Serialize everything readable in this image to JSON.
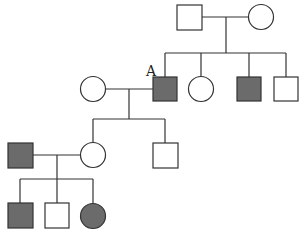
{
  "colors": {
    "affected": "#6b6b6b",
    "unaffected": "#ffffff",
    "line": "#333333"
  },
  "label_A": "A",
  "individuals": [
    {
      "id": "I-1",
      "sex": "male",
      "affected": false
    },
    {
      "id": "I-2",
      "sex": "female",
      "affected": false
    },
    {
      "id": "II-1",
      "sex": "female",
      "affected": false,
      "note": "spouse of A"
    },
    {
      "id": "II-2",
      "sex": "male",
      "affected": true,
      "label": "A"
    },
    {
      "id": "II-3",
      "sex": "female",
      "affected": false
    },
    {
      "id": "II-4",
      "sex": "male",
      "affected": true
    },
    {
      "id": "II-5",
      "sex": "male",
      "affected": false
    },
    {
      "id": "III-1",
      "sex": "male",
      "affected": true,
      "note": "spouse of III-2"
    },
    {
      "id": "III-2",
      "sex": "female",
      "affected": false
    },
    {
      "id": "III-3",
      "sex": "male",
      "affected": false
    },
    {
      "id": "IV-1",
      "sex": "male",
      "affected": true
    },
    {
      "id": "IV-2",
      "sex": "male",
      "affected": false
    },
    {
      "id": "IV-3",
      "sex": "female",
      "affected": true
    }
  ]
}
